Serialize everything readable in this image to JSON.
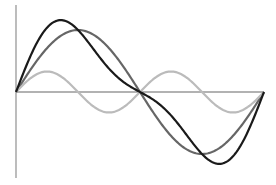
{
  "chart_data": {
    "type": "line",
    "title": "",
    "xlabel": "",
    "ylabel": "",
    "grid": false,
    "legend": null,
    "xlim": [
      0,
      6.2832
    ],
    "ylim": [
      -1.2,
      1.2
    ],
    "x_description": "theta from 0 to 2*pi",
    "series": [
      {
        "name": "sin(x)",
        "formula": "sin(x)",
        "amplitude": 1.0,
        "color": "#666666",
        "width": 2.2
      },
      {
        "name": "0.33*sin(2x)",
        "formula": "0.33*sin(2x)",
        "amplitude": 0.33,
        "color": "#bbbbbb",
        "width": 2.2
      },
      {
        "name": "sin(x)+0.33*sin(2x)",
        "formula": "sin(x)+0.33*sin(2x)",
        "amplitude": 1.15,
        "color": "#1a1a1a",
        "width": 2.2
      }
    ],
    "axes": {
      "color": "#999999",
      "x_axis_at": 0,
      "y_axis_at": 0
    }
  },
  "layout": {
    "origin_px": [
      16,
      92
    ],
    "x_end_px": 264,
    "y_axis_top_px": 5,
    "y_axis_bottom_px": 178,
    "unit_px": 62
  }
}
